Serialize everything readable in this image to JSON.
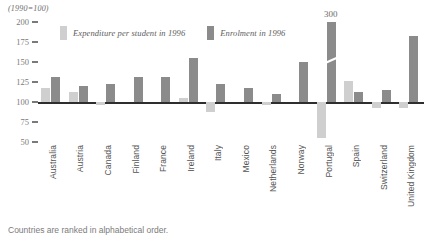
{
  "header": {
    "unit_note": "(1990=100)"
  },
  "legend": {
    "position": "top-left-inside",
    "items": [
      {
        "label": "Expenditure per student in 1996",
        "color": "#cfcfcf",
        "key": "expenditure"
      },
      {
        "label": "Enrolment in 1996",
        "color": "#8b8b8b",
        "key": "enrolment"
      }
    ]
  },
  "annotations": [
    {
      "text": "300",
      "series": "enrolment",
      "category": "Portugal",
      "note": "broken bar value label"
    }
  ],
  "caption": "Countries are ranked in alphabetical order.",
  "chart_data": {
    "type": "bar",
    "title": "",
    "subtitle": "",
    "xlabel": "",
    "ylabel": "",
    "unit_note": "(1990=100)",
    "ylim": [
      50,
      200
    ],
    "yticks": [
      200,
      175,
      150,
      125,
      100,
      75,
      50
    ],
    "baseline": 100,
    "grid": false,
    "legend_position": "top-left",
    "categories": [
      "Australia",
      "Austria",
      "Canada",
      "Finland",
      "France",
      "Ireland",
      "Italy",
      "Mexico",
      "Netherlands",
      "Norway",
      "Portugal",
      "Spain",
      "Switzerland",
      "United Kingdom"
    ],
    "series": [
      {
        "name": "Expenditure per student in 1996",
        "color": "#cfcfcf",
        "values": [
          117,
          112,
          96,
          100,
          100,
          105,
          88,
          100,
          96,
          100,
          55,
          126,
          93,
          92
        ]
      },
      {
        "name": "Enrolment in 1996",
        "color": "#8b8b8b",
        "values": [
          131,
          120,
          122,
          131,
          131,
          155,
          122,
          118,
          110,
          150,
          300,
          112,
          115,
          182
        ],
        "broken_bars": [
          {
            "category": "Portugal",
            "displayed_value": 300,
            "axis_cut": true
          }
        ]
      }
    ]
  }
}
